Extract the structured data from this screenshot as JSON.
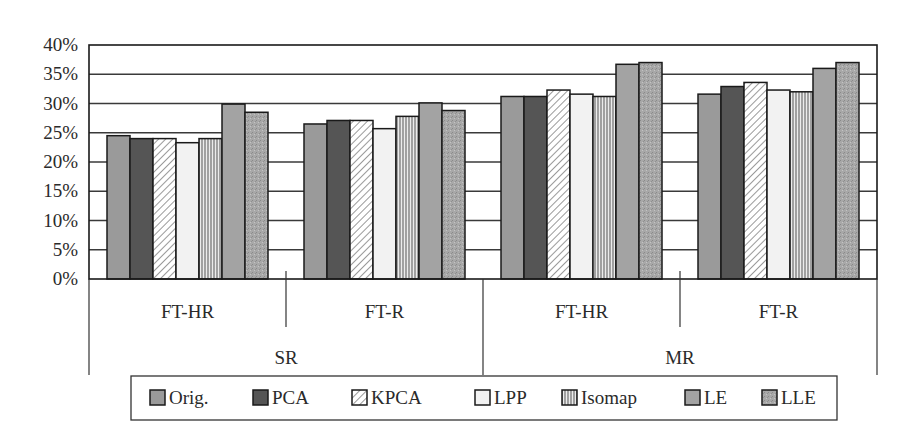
{
  "chart_data": {
    "type": "bar",
    "title": "",
    "xlabel": "",
    "ylabel": "",
    "ylim": [
      0,
      40
    ],
    "y_ticks": [
      "0%",
      "5%",
      "10%",
      "15%",
      "20%",
      "25%",
      "30%",
      "35%",
      "40%"
    ],
    "grid": true,
    "legend_position": "bottom",
    "outer_categories": [
      "SR",
      "MR"
    ],
    "inner_categories": [
      "FT-HR",
      "FT-R"
    ],
    "categories": [
      "SR / FT-HR",
      "SR / FT-R",
      "MR / FT-HR",
      "MR / FT-R"
    ],
    "series": [
      {
        "name": "Orig.",
        "fill": "#9a9a9a",
        "pattern": "solid",
        "values": [
          24.5,
          26.5,
          31.2,
          31.6
        ]
      },
      {
        "name": "PCA",
        "fill": "#555555",
        "pattern": "solid",
        "values": [
          24.0,
          27.1,
          31.2,
          32.9
        ]
      },
      {
        "name": "KPCA",
        "fill": "#ffffff",
        "pattern": "diagonal",
        "values": [
          24.0,
          27.1,
          32.3,
          33.6
        ]
      },
      {
        "name": "LPP",
        "fill": "#f2f2f2",
        "pattern": "solid",
        "values": [
          23.3,
          25.7,
          31.6,
          32.3
        ]
      },
      {
        "name": "Isomap",
        "fill": "#ffffff",
        "pattern": "vertical",
        "values": [
          24.0,
          27.8,
          31.2,
          32.0
        ]
      },
      {
        "name": "LE",
        "fill": "#a3a3a3",
        "pattern": "solid",
        "values": [
          29.9,
          30.1,
          36.7,
          36.0
        ]
      },
      {
        "name": "LLE",
        "fill": "#a8a8a8",
        "pattern": "speckle",
        "values": [
          28.5,
          28.8,
          37.0,
          37.0
        ]
      }
    ]
  }
}
